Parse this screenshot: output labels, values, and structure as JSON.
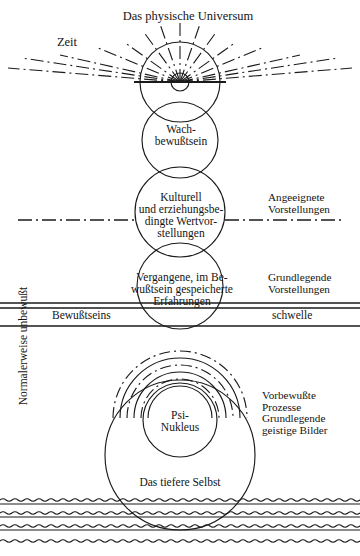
{
  "diagram": {
    "title_text": "Das physische Universum",
    "labels": {
      "universe": "Das physische Universum",
      "time": "Zeit",
      "waking": "Wach-\nbewußtsein",
      "cultural": "Kulturell\nund erziehungsbe-\ndingte Wertvor-\nstellungen",
      "past": "Vergangene, im Be-\nwußtsein gespeicherte\nErfahrungen",
      "psi": "Psi-\nNukleus",
      "deeper_self": "Das tiefere Selbst",
      "acquired": "Angeeignete\nVorstellungen",
      "fundamental": "Grundlegende\nVorstellungen",
      "preconscious": "Vorbewußte\nProzesse\nGrundlegende\ngeistige Bilder",
      "threshold_left": "Bewußtseins",
      "threshold_right": "schwelle",
      "normally_unconscious": "Normalerweise unbewußt"
    },
    "colors": {
      "stroke": "#1a1a1a",
      "background": "#ffffff"
    }
  }
}
